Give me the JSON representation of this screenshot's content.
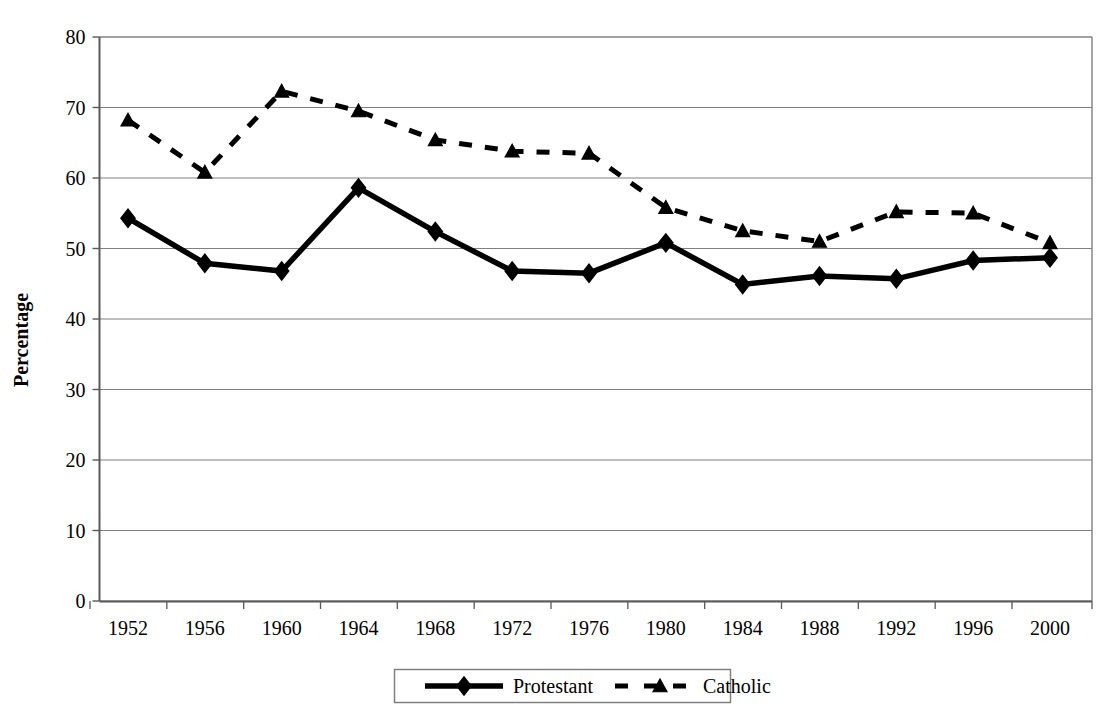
{
  "chart_data": {
    "type": "line",
    "title": "",
    "xlabel": "",
    "ylabel": "Percentage",
    "x": [
      1952,
      1956,
      1960,
      1964,
      1968,
      1972,
      1976,
      1980,
      1984,
      1988,
      1992,
      1996,
      2000
    ],
    "categories": [
      "1952",
      "1956",
      "1960",
      "1964",
      "1968",
      "1972",
      "1976",
      "1980",
      "1984",
      "1988",
      "1992",
      "1996",
      "2000"
    ],
    "series": [
      {
        "name": "Protestant",
        "marker": "diamond",
        "line_style": "solid",
        "color": "#000000",
        "values": [
          54.3,
          47.9,
          46.8,
          58.6,
          52.4,
          46.8,
          46.5,
          50.8,
          44.9,
          46.1,
          45.7,
          48.3,
          48.7
        ]
      },
      {
        "name": "Catholic",
        "marker": "triangle",
        "line_style": "dashed",
        "color": "#000000",
        "values": [
          68.2,
          60.8,
          72.3,
          69.5,
          65.4,
          63.8,
          63.5,
          55.8,
          52.5,
          51.0,
          55.2,
          55.0,
          50.8
        ]
      }
    ],
    "ylim": [
      0,
      80
    ],
    "ytick_values": [
      0,
      10,
      20,
      30,
      40,
      50,
      60,
      70,
      80
    ],
    "ytick_labels": [
      "0",
      "10",
      "20",
      "30",
      "40",
      "50",
      "60",
      "70",
      "80"
    ],
    "grid": "horizontal",
    "legend_position": "bottom"
  },
  "legend": {
    "items": [
      {
        "label": "Protestant"
      },
      {
        "label": "Catholic"
      }
    ]
  },
  "colors": {
    "axis": "#000000",
    "grid": "#808080",
    "plot_border": "#808080",
    "series": "#000000",
    "background": "#ffffff"
  }
}
